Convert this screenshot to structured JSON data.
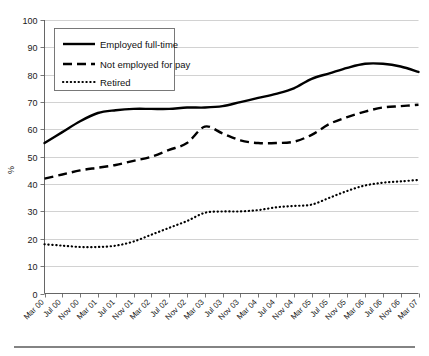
{
  "chart_data": {
    "type": "line",
    "title": "",
    "xlabel": "",
    "ylabel": "%",
    "ylim": [
      0,
      100
    ],
    "ytick_step": 10,
    "grid": true,
    "legend_position": "top-left-inside",
    "yticks": [
      "0",
      "10",
      "20",
      "30",
      "40",
      "50",
      "60",
      "70",
      "80",
      "90",
      "100"
    ],
    "categories": [
      "Mar 00",
      "Jul 00",
      "Nov 00",
      "Mar 01",
      "Jul 01",
      "Nov 01",
      "Mar 02",
      "Jul 02",
      "Nov 02",
      "Mar 03",
      "Jul 03",
      "Nov 03",
      "Mar 04",
      "Jul 04",
      "Nov 04",
      "Mar 05",
      "Jul 05",
      "Nov 05",
      "Mar 06",
      "Jul 06",
      "Nov 06",
      "Mar 07"
    ],
    "series": [
      {
        "name": "Employed full-time",
        "style": "solid",
        "color": "#000000",
        "values": [
          55,
          59,
          63,
          66,
          67,
          67.5,
          67.5,
          67.5,
          68,
          68,
          68.5,
          70,
          71.5,
          73,
          75,
          78.5,
          80.5,
          82.5,
          84,
          84,
          83,
          81
        ]
      },
      {
        "name": "Not employed for pay",
        "style": "dashed",
        "color": "#000000",
        "values": [
          42,
          43.5,
          45,
          46,
          47,
          48.5,
          50,
          52.5,
          55,
          61,
          58.5,
          56,
          55,
          55,
          55.5,
          58,
          62,
          64.5,
          66.5,
          68,
          68.5,
          69
        ]
      },
      {
        "name": "Retired",
        "style": "dotted",
        "color": "#000000",
        "values": [
          18,
          17.5,
          17,
          17,
          17.5,
          19,
          21.5,
          24,
          26.5,
          29.5,
          30,
          30,
          30.5,
          31.5,
          32,
          32.5,
          35,
          37.5,
          39.5,
          40.5,
          41,
          41.5
        ]
      }
    ]
  },
  "legend": {
    "items": [
      {
        "label": "Employed full-time",
        "style": "solid"
      },
      {
        "label": "Not employed for pay",
        "style": "dashed"
      },
      {
        "label": "Retired",
        "style": "dotted"
      }
    ]
  }
}
